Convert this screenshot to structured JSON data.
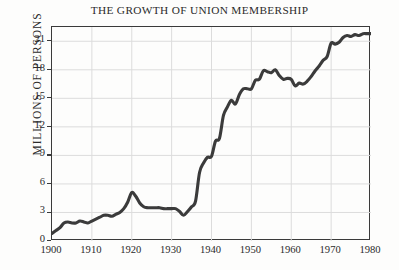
{
  "chart_data": {
    "type": "line",
    "title": "THE GROWTH OF UNION MEMBERSHIP",
    "xlabel": "",
    "ylabel": "MILLIONS OF PERSONS",
    "xlim": [
      1900,
      1980
    ],
    "ylim": [
      0,
      22.5
    ],
    "grid": true,
    "legend": null,
    "line_color": "#3b3b3b",
    "grid_color": "#dcdcdc",
    "frame_color": "#3a3a3a",
    "background_color": "#fdfdfc",
    "xticks": [
      1900,
      1910,
      1920,
      1930,
      1940,
      1950,
      1960,
      1970,
      1980
    ],
    "xtick_labels": [
      "1900",
      "1910",
      "1920",
      "1930",
      "1940",
      "1950",
      "1960",
      "1970",
      "1980"
    ],
    "yticks": [
      0,
      3,
      6,
      9,
      12,
      15,
      18,
      21
    ],
    "ytick_labels": [
      "0",
      "3",
      "6",
      "9",
      "12",
      "15",
      "18",
      "21"
    ],
    "series": [
      {
        "name": "Union membership",
        "x": [
          1900,
          1901,
          1902,
          1903,
          1904,
          1905,
          1906,
          1907,
          1908,
          1909,
          1910,
          1911,
          1912,
          1913,
          1914,
          1915,
          1916,
          1917,
          1918,
          1919,
          1920,
          1921,
          1922,
          1923,
          1924,
          1925,
          1926,
          1927,
          1928,
          1929,
          1930,
          1931,
          1932,
          1933,
          1934,
          1935,
          1936,
          1937,
          1938,
          1939,
          1940,
          1941,
          1942,
          1943,
          1944,
          1945,
          1946,
          1947,
          1948,
          1949,
          1950,
          1951,
          1952,
          1953,
          1954,
          1955,
          1956,
          1957,
          1958,
          1959,
          1960,
          1961,
          1962,
          1963,
          1964,
          1965,
          1966,
          1967,
          1968,
          1969,
          1970,
          1971,
          1972,
          1973,
          1974,
          1975,
          1976,
          1977,
          1978,
          1979,
          1980
        ],
        "y": [
          0.8,
          1.1,
          1.4,
          1.9,
          2.0,
          1.9,
          1.9,
          2.1,
          2.0,
          1.9,
          2.1,
          2.3,
          2.5,
          2.7,
          2.7,
          2.6,
          2.8,
          3.0,
          3.4,
          4.1,
          5.1,
          4.7,
          4.0,
          3.6,
          3.5,
          3.5,
          3.5,
          3.5,
          3.4,
          3.4,
          3.4,
          3.4,
          3.1,
          2.7,
          3.1,
          3.6,
          4.2,
          7.2,
          8.2,
          8.8,
          8.9,
          10.5,
          10.8,
          13.2,
          14.1,
          14.8,
          14.4,
          15.4,
          16.0,
          16.0,
          16.0,
          16.9,
          17.0,
          17.9,
          17.8,
          17.7,
          18.0,
          17.4,
          17.0,
          17.1,
          17.0,
          16.3,
          16.6,
          16.5,
          16.8,
          17.3,
          17.9,
          18.4,
          19.0,
          19.4,
          20.8,
          20.7,
          20.9,
          21.4,
          21.6,
          21.5,
          21.7,
          21.6,
          21.8,
          21.8,
          21.8
        ]
      }
    ]
  },
  "chart_meta": {
    "geometry": {
      "plot_left": 51,
      "plot_top": 26,
      "plot_width": 319,
      "plot_height": 214
    }
  }
}
